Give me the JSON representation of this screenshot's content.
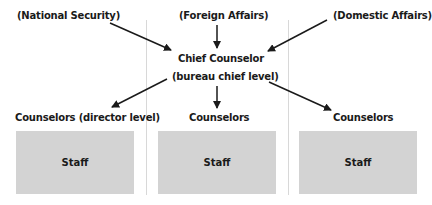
{
  "diagram": {
    "inputs": [
      {
        "label": "(National Security)"
      },
      {
        "label": "(Foreign Affairs)"
      },
      {
        "label": "(Domestic Affairs)"
      }
    ],
    "center": {
      "title": "Chief Counselor",
      "subtitle": "(bureau chief level)"
    },
    "outputs": [
      {
        "label": "Counselors (director level)",
        "box": "Staff"
      },
      {
        "label": "Counselors",
        "box": "Staff"
      },
      {
        "label": "Counselors",
        "box": "Staff"
      }
    ],
    "colors": {
      "staff_box": "#d3d3d3",
      "divider": "#d8d8d8",
      "arrow": "#1a1a1a",
      "text": "#1a1a1a"
    }
  }
}
